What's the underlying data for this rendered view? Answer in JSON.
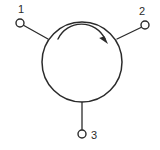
{
  "diagram": {
    "background_color": "#ffffff",
    "line_color": "#2b2b2b",
    "body": {
      "shape": "circle",
      "center_x": 82,
      "center_y": 62,
      "radius": 40
    },
    "rotation_arrow": {
      "direction": "clockwise",
      "position": "inside-top",
      "arc_radius": 26
    },
    "ports": [
      {
        "id": "port-1",
        "label": "1",
        "label_x": 21,
        "label_y": 12,
        "dot_x": 20,
        "dot_y": 23,
        "dot_radius": 4,
        "lead_to_x": 48,
        "lead_to_y": 39
      },
      {
        "id": "port-2",
        "label": "2",
        "label_x": 141,
        "label_y": 14,
        "dot_x": 145,
        "dot_y": 25,
        "dot_radius": 4,
        "lead_to_x": 117,
        "lead_to_y": 39
      },
      {
        "id": "port-3",
        "label": "3",
        "label_x": 92,
        "label_y": 138,
        "dot_x": 82,
        "dot_y": 134,
        "dot_radius": 4,
        "lead_to_x": 82,
        "lead_to_y": 102
      }
    ]
  }
}
